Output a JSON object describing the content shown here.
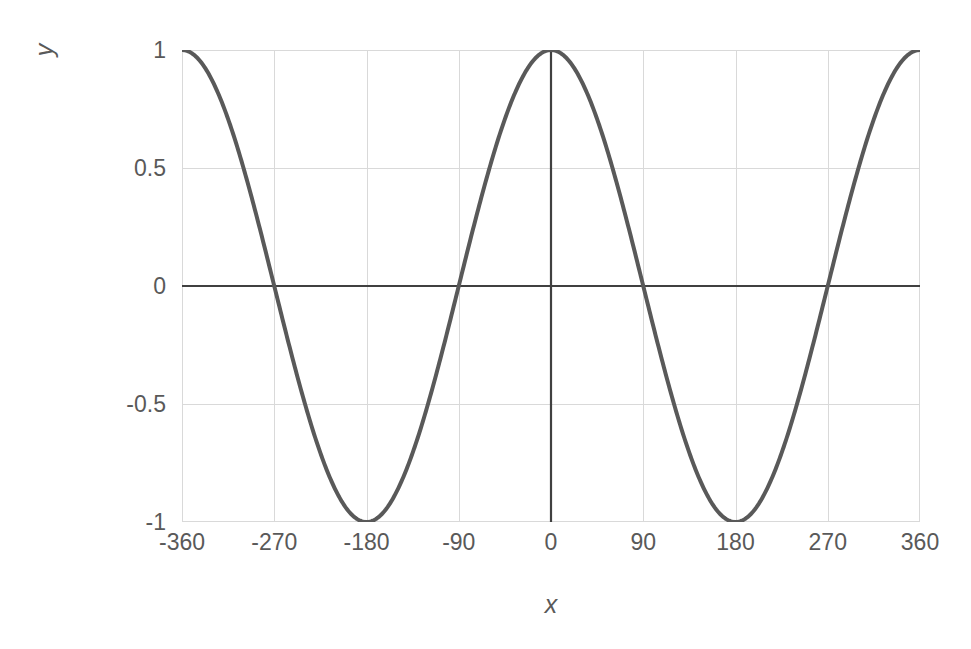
{
  "chart_data": {
    "type": "line",
    "title": "",
    "subtitle": "",
    "xlabel": "x",
    "ylabel": "y",
    "xlim": [
      -360,
      360
    ],
    "ylim": [
      -1,
      1
    ],
    "grid": true,
    "legend": false,
    "legend_position": "none",
    "x_ticks": [
      "-360",
      "-270",
      "-180",
      "-90",
      "0",
      "90",
      "180",
      "270",
      "360"
    ],
    "x_tick_values": [
      -360,
      -270,
      -180,
      -90,
      0,
      90,
      180,
      270,
      360
    ],
    "y_ticks": [
      "1",
      "0.5",
      "0",
      "-0.5",
      "-1"
    ],
    "y_tick_values": [
      1,
      0.5,
      0,
      -0.5,
      -1
    ],
    "series": [
      {
        "name": "cos(x)",
        "function": "y = cos(x)",
        "x_unit": "degrees",
        "color": "#595959",
        "line_width": 4,
        "x": [
          -360,
          -350,
          -340,
          -330,
          -320,
          -310,
          -300,
          -290,
          -280,
          -270,
          -260,
          -250,
          -240,
          -230,
          -220,
          -210,
          -200,
          -190,
          -180,
          -170,
          -160,
          -150,
          -140,
          -130,
          -120,
          -110,
          -100,
          -90,
          -80,
          -70,
          -60,
          -50,
          -40,
          -30,
          -20,
          -10,
          0,
          10,
          20,
          30,
          40,
          50,
          60,
          70,
          80,
          90,
          100,
          110,
          120,
          130,
          140,
          150,
          160,
          170,
          180,
          190,
          200,
          210,
          220,
          230,
          240,
          250,
          260,
          270,
          280,
          290,
          300,
          310,
          320,
          330,
          340,
          350,
          360
        ],
        "values": [
          1,
          0.985,
          0.94,
          0.866,
          0.766,
          0.643,
          0.5,
          0.342,
          0.174,
          0,
          -0.174,
          -0.342,
          -0.5,
          -0.643,
          -0.766,
          -0.866,
          -0.94,
          -0.985,
          -1,
          -0.985,
          -0.94,
          -0.866,
          -0.766,
          -0.643,
          -0.5,
          -0.342,
          -0.174,
          0,
          0.174,
          0.342,
          0.5,
          0.643,
          0.766,
          0.866,
          0.94,
          0.985,
          1,
          0.985,
          0.94,
          0.866,
          0.766,
          0.643,
          0.5,
          0.342,
          0.174,
          0,
          -0.174,
          -0.342,
          -0.5,
          -0.643,
          -0.766,
          -0.866,
          -0.94,
          -0.985,
          -1,
          -0.985,
          -0.94,
          -0.866,
          -0.766,
          -0.643,
          -0.5,
          -0.342,
          -0.174,
          0,
          0.174,
          0.342,
          0.5,
          0.643,
          0.766,
          0.866,
          0.94,
          0.985,
          1
        ]
      }
    ],
    "annotations": [],
    "key_points": {
      "maxima": [
        {
          "x": -360,
          "y": 1
        },
        {
          "x": 0,
          "y": 1
        },
        {
          "x": 360,
          "y": 1
        }
      ],
      "minima": [
        {
          "x": -180,
          "y": -1
        },
        {
          "x": 180,
          "y": -1
        }
      ],
      "zero_crossings": [
        -270,
        -90,
        90,
        270
      ]
    },
    "colors": {
      "curve": "#595959",
      "gridline": "#d9d9d9",
      "plot_border": "#d9d9d9",
      "axis_line": "#404040",
      "tick_label": "#595959",
      "axis_title": "#595959",
      "background": "#ffffff"
    }
  }
}
